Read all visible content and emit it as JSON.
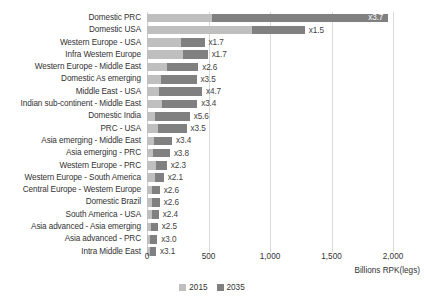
{
  "chart_data": {
    "type": "bar",
    "orientation": "horizontal",
    "stacked": true,
    "title": "",
    "subtitle": "",
    "xlabel": "Billions RPK(legs)",
    "ylabel": "",
    "xlim": [
      0,
      2000
    ],
    "xticks": [
      0,
      500,
      1000,
      1500,
      2000
    ],
    "xticklabels": [
      "0",
      "500",
      "1,000",
      "1,500",
      "2,000"
    ],
    "grid": true,
    "legend_position": "bottom",
    "legend": [
      "2015",
      "2035"
    ],
    "series": [
      {
        "name": "2015",
        "color": "#bfbfbf",
        "values": [
          530,
          855,
          275,
          290,
          160,
          115,
          95,
          120,
          62,
          92,
          60,
          49,
          70,
          65,
          40,
          40,
          40,
          35,
          28,
          24
        ]
      },
      {
        "name": "2035",
        "color": "#808080",
        "values": [
          1431,
          428,
          193,
          203,
          256,
          288,
          352,
          288,
          285,
          230,
          144,
          137,
          91,
          72,
          64,
          64,
          56,
          53,
          56,
          50
        ]
      }
    ],
    "categories": [
      "Domestic PRC",
      "Domestic USA",
      "Western Europe - USA",
      "Infra Western Europe",
      "Western Europe - Middle East",
      "Domestic As emerging",
      "Middle East - USA",
      "Indian sub-continent - Middle East",
      "Domestic India",
      "PRC - USA",
      "Asia emerging - Middle East",
      "Asia emerging - PRC",
      "Western Europe - PRC",
      "Western Europe - South America",
      "Central Europe - Western Europe",
      "Domestic Brazil",
      "South America - USA",
      "Asia advanced - Asia emerging",
      "Asia advanced - PRC",
      "Intra Middle East"
    ],
    "annotations": [
      {
        "category": "Domestic PRC",
        "label": "x3.7",
        "total": 1961
      },
      {
        "category": "Domestic USA",
        "label": "x1.5",
        "total": 1283
      },
      {
        "category": "Western Europe - USA",
        "label": "x1.7",
        "total": 468
      },
      {
        "category": "Infra Western Europe",
        "label": "x1.7",
        "total": 493
      },
      {
        "category": "Western Europe - Middle East",
        "label": "x2.6",
        "total": 416
      },
      {
        "category": "Domestic As emerging",
        "label": "x3.5",
        "total": 403
      },
      {
        "category": "Middle East - USA",
        "label": "x4.7",
        "total": 447
      },
      {
        "category": "Indian sub-continent - Middle East",
        "label": "x3.4",
        "total": 408
      },
      {
        "category": "Domestic India",
        "label": "x5.6",
        "total": 347
      },
      {
        "category": "PRC - USA",
        "label": "x3.5",
        "total": 322
      },
      {
        "category": "Asia emerging - Middle East",
        "label": "x3.4",
        "total": 204
      },
      {
        "category": "Asia emerging - PRC",
        "label": "x3.8",
        "total": 186
      },
      {
        "category": "Western Europe - PRC",
        "label": "x2.3",
        "total": 161
      },
      {
        "category": "Western Europe - South America",
        "label": "x2.1",
        "total": 137
      },
      {
        "category": "Central Europe - Western Europe",
        "label": "x2.6",
        "total": 104
      },
      {
        "category": "Domestic Brazil",
        "label": "x2.6",
        "total": 104
      },
      {
        "category": "South America - USA",
        "label": "x2.4",
        "total": 96
      },
      {
        "category": "Asia advanced - Asia emerging",
        "label": "x2.5",
        "total": 88
      },
      {
        "category": "Asia advanced - PRC",
        "label": "x3.0",
        "total": 84
      },
      {
        "category": "Intra Middle East",
        "label": "x3.1",
        "total": 74
      }
    ]
  }
}
